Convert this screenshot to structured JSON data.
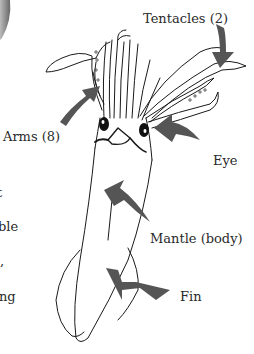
{
  "diagram": {
    "labels": {
      "tentacles": "Tentacles (2)",
      "arms": "Arms (8)",
      "eye": "Eye",
      "mantle": "Mantle (body)",
      "fin": "Fin"
    },
    "left_text_fragments": [
      "t",
      "ble",
      ",",
      "ng"
    ],
    "colors": {
      "arrow": "#555555",
      "outline": "#1a1a1a",
      "text": "#2a2a2a",
      "background": "#ffffff"
    }
  }
}
